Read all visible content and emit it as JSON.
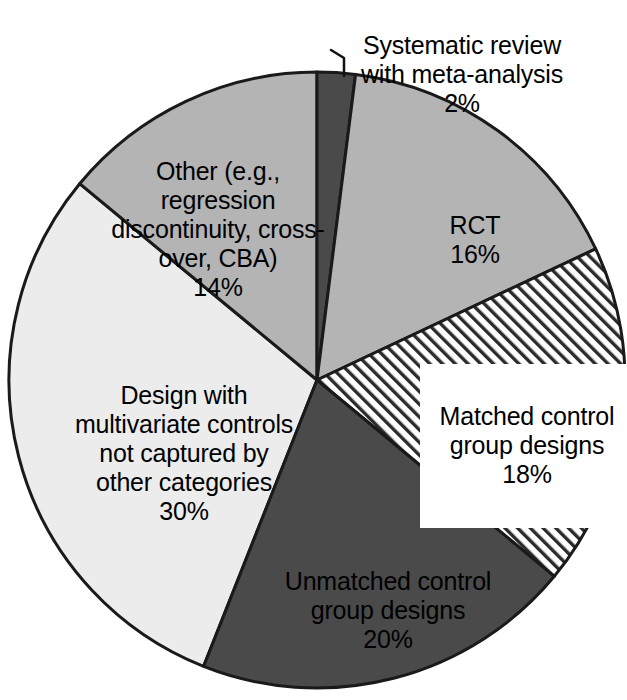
{
  "chart_data": {
    "type": "pie",
    "title": "",
    "subtitle": "",
    "xlabel": "",
    "ylabel": "",
    "legend_position": "none",
    "labels_on_slices": true,
    "start_angle_deg": 0,
    "direction": "clockwise",
    "categories": [
      "Systematic review with meta-analysis",
      "RCT",
      "Matched control group designs",
      "Unmatched control group designs",
      "Design with multivariate controls not captured by other categories",
      "Other (e.g., regression discontinuity, cross-over, CBA)"
    ],
    "values": [
      2,
      16,
      18,
      20,
      30,
      14
    ],
    "value_unit": "%",
    "slices": [
      {
        "name": "systematic-review",
        "label": "Systematic review\nwith meta-analysis",
        "value": 2,
        "value_label": "2%",
        "fill": "#4a4a4a",
        "pattern": "solid",
        "start_deg": 0,
        "end_deg": 7.2,
        "label_placement": "outside-with-leader"
      },
      {
        "name": "rct",
        "label": "RCT",
        "value": 16,
        "value_label": "16%",
        "fill": "#b4b4b4",
        "pattern": "solid",
        "start_deg": 7.2,
        "end_deg": 64.8,
        "label_placement": "inside"
      },
      {
        "name": "matched-control",
        "label": "Matched control\ngroup designs",
        "value": 18,
        "value_label": "18%",
        "fill": "#ffffff",
        "pattern": "diagonal-hatch",
        "start_deg": 64.8,
        "end_deg": 129.6,
        "label_placement": "inside-boxed"
      },
      {
        "name": "unmatched-control",
        "label": "Unmatched control\ngroup designs",
        "value": 20,
        "value_label": "20%",
        "fill": "#4a4a4a",
        "pattern": "solid",
        "start_deg": 129.6,
        "end_deg": 201.6,
        "label_placement": "inside"
      },
      {
        "name": "multivariate-controls",
        "label": "Design with\nmultivariate controls\nnot captured by\nother categories",
        "value": 30,
        "value_label": "30%",
        "fill": "#ececec",
        "pattern": "solid",
        "start_deg": 201.6,
        "end_deg": 309.6,
        "label_placement": "inside"
      },
      {
        "name": "other-designs",
        "label": "Other (e.g.,\nregression\ndiscontinuity, cross-\nover, CBA)",
        "value": 14,
        "value_label": "14%",
        "fill": "#b4b4b4",
        "pattern": "solid",
        "start_deg": 309.6,
        "end_deg": 360,
        "label_placement": "inside"
      }
    ],
    "colors": {
      "outline": "#1a1a1a",
      "dark_gray": "#4a4a4a",
      "medium_gray": "#b4b4b4",
      "light_gray": "#ececec",
      "hatch_white": "#ffffff",
      "text": "#000000",
      "background": "#ffffff"
    }
  }
}
